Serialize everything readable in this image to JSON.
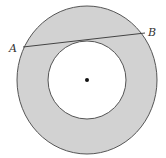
{
  "figure": {
    "type": "annulus-with-tangent-chord",
    "width": 166,
    "height": 158,
    "center": {
      "x": 87,
      "y": 80
    },
    "outer_circle": {
      "rx": 70,
      "ry": 74
    },
    "inner_circle": {
      "r": 39
    },
    "chord": {
      "x1": 23,
      "y1": 47,
      "x2": 145,
      "y2": 33
    },
    "labels": {
      "point_a": {
        "text": "A",
        "x": 9,
        "y": 52
      },
      "point_b": {
        "text": "B",
        "x": 148,
        "y": 36
      }
    },
    "colors": {
      "ring_fill": "#d2d2d2",
      "inner_fill": "#ffffff",
      "stroke": "#555555",
      "center_dot": "#111111"
    }
  }
}
